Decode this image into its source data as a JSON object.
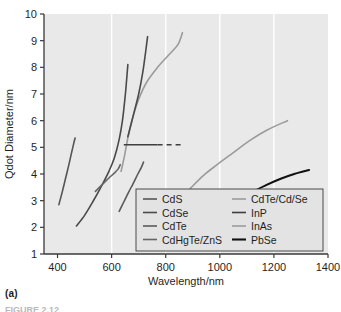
{
  "panel": {
    "label": "(a)",
    "caption": "FIGURE 2.12"
  },
  "chart_data": {
    "type": "line",
    "title": "",
    "xlabel": "Wavelength/nm",
    "ylabel": "Qdot Diameter/nm",
    "xlim": [
      350,
      1400
    ],
    "ylim": [
      1,
      10
    ],
    "xticks": [
      400,
      600,
      800,
      1000,
      1200,
      1400
    ],
    "yticks": [
      1,
      2,
      3,
      4,
      5,
      6,
      7,
      8,
      9,
      10
    ],
    "grid": "vertical-white",
    "plot_background": "#e9e9e9",
    "legend_position": "bottom-center-right",
    "legend_columns": 2,
    "series": [
      {
        "name": "CdS",
        "color": "#555555",
        "width": 1.6,
        "dash": "none",
        "points": [
          [
            405,
            2.85
          ],
          [
            418,
            3.35
          ],
          [
            430,
            3.85
          ],
          [
            442,
            4.35
          ],
          [
            452,
            4.8
          ],
          [
            460,
            5.15
          ],
          [
            465,
            5.35
          ]
        ]
      },
      {
        "name": "CdSe",
        "color": "#4a4a4a",
        "width": 1.6,
        "dash": "none",
        "points": [
          [
            470,
            2.05
          ],
          [
            500,
            2.45
          ],
          [
            530,
            2.95
          ],
          [
            560,
            3.5
          ],
          [
            590,
            4.1
          ],
          [
            610,
            4.6
          ],
          [
            628,
            5.3
          ],
          [
            640,
            6.0
          ],
          [
            650,
            6.9
          ],
          [
            656,
            7.6
          ],
          [
            660,
            8.1
          ]
        ]
      },
      {
        "name": "CdTe",
        "color": "#5a5a5a",
        "width": 1.6,
        "dash": "none",
        "points": [
          [
            628,
            2.6
          ],
          [
            645,
            2.95
          ],
          [
            662,
            3.3
          ],
          [
            680,
            3.65
          ],
          [
            697,
            4.0
          ],
          [
            710,
            4.25
          ],
          [
            718,
            4.45
          ]
        ]
      },
      {
        "name": "CdHgTe/ZnS",
        "color": "#656565",
        "width": 1.6,
        "dash": "none",
        "points": [
          [
            540,
            3.35
          ],
          [
            565,
            3.6
          ],
          [
            590,
            3.85
          ],
          [
            612,
            4.05
          ],
          [
            625,
            4.2
          ],
          [
            632,
            4.35
          ]
        ]
      },
      {
        "name": "CdTe/Cd/Se",
        "color": "#9b9b9b",
        "width": 1.6,
        "dash": "none",
        "points": [
          [
            635,
            4.1
          ],
          [
            648,
            4.7
          ],
          [
            660,
            5.35
          ],
          [
            678,
            6.1
          ],
          [
            700,
            6.8
          ],
          [
            730,
            7.45
          ],
          [
            770,
            8.0
          ],
          [
            810,
            8.45
          ],
          [
            845,
            8.85
          ],
          [
            862,
            9.3
          ]
        ]
      },
      {
        "name": "InP",
        "color": "#3f3f3f",
        "width": 1.5,
        "dash": "solid-then-dashed",
        "points": [
          [
            645,
            5.1
          ],
          [
            862,
            5.1
          ]
        ],
        "solid_until": 770
      },
      {
        "name": "InAs",
        "color": "#9b9b9b",
        "width": 1.6,
        "dash": "none",
        "points": [
          [
            890,
            3.45
          ],
          [
            940,
            3.95
          ],
          [
            990,
            4.35
          ],
          [
            1050,
            4.8
          ],
          [
            1110,
            5.25
          ],
          [
            1175,
            5.65
          ],
          [
            1250,
            6.0
          ]
        ]
      },
      {
        "name": "PbSe",
        "color": "#111111",
        "width": 2.1,
        "dash": "none",
        "points": [
          [
            1125,
            3.35
          ],
          [
            1175,
            3.6
          ],
          [
            1225,
            3.82
          ],
          [
            1275,
            4.0
          ],
          [
            1330,
            4.15
          ]
        ]
      }
    ],
    "extra_series": [
      {
        "name": "CdSe-upper-branch",
        "color": "#4a4a4a",
        "width": 1.6,
        "points": [
          [
            660,
            5.4
          ],
          [
            680,
            6.2
          ],
          [
            700,
            7.0
          ],
          [
            715,
            7.8
          ],
          [
            726,
            8.6
          ],
          [
            733,
            9.15
          ]
        ]
      }
    ]
  }
}
